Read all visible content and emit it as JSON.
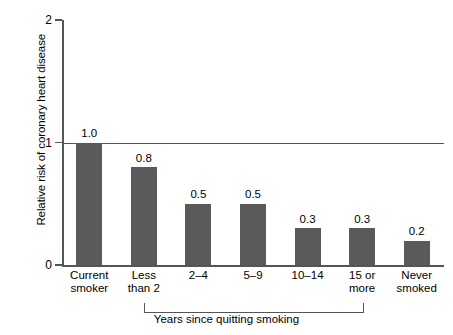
{
  "chart_data": {
    "type": "bar",
    "title": "",
    "xlabel": "Years since quitting smoking",
    "ylabel": "Relative risk of coronary heart disease",
    "categories": [
      "Current\nsmoker",
      "Less\nthan 2",
      "2–4",
      "5–9",
      "10–14",
      "15 or\nmore",
      "Never\nsmoked"
    ],
    "values": [
      1.0,
      0.8,
      0.5,
      0.5,
      0.3,
      0.3,
      0.2
    ],
    "value_labels": [
      "1.0",
      "0.8",
      "0.5",
      "0.5",
      "0.3",
      "0.3",
      "0.2"
    ],
    "ylim": [
      0,
      2
    ],
    "yticks": [
      0,
      1,
      2
    ],
    "ytick_labels": [
      "0",
      "1",
      "2"
    ],
    "grid": false,
    "reference_line": 1.0,
    "legend": "none",
    "bar_color": "#5a5a5a",
    "axis_color": "#555555",
    "group_bracket": {
      "label": "Years since quitting smoking",
      "from_category": "Less\nthan 2",
      "to_category": "15 or\nmore"
    }
  }
}
